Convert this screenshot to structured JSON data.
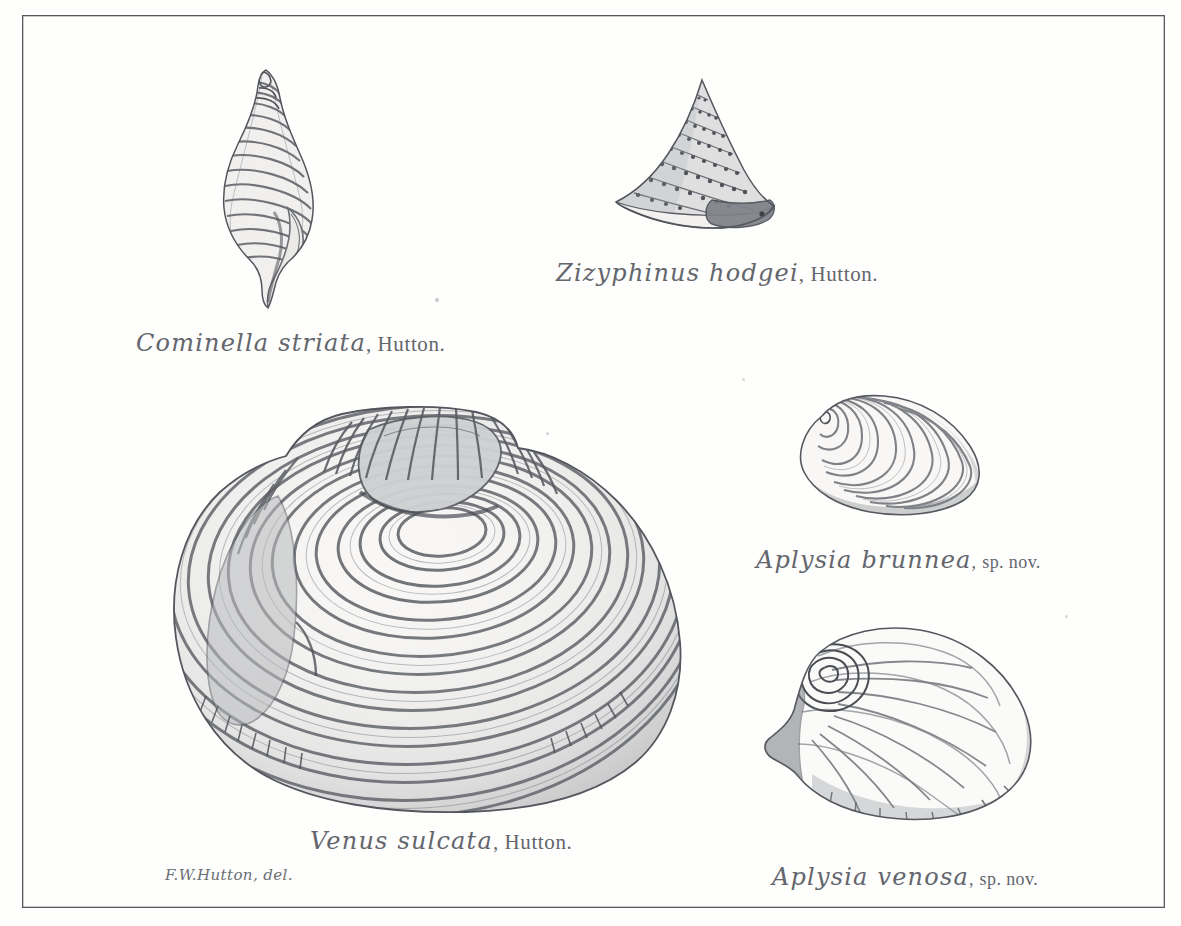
{
  "plate": {
    "background_color": "#fefefd",
    "frame_color": "#555a5e",
    "ink_color": "#63666c",
    "medium": "lithograph",
    "credit": "F.W.Hutton, del."
  },
  "figures": [
    {
      "id": "cominella-striata",
      "icon": "gastropod-fusiform-shell-icon",
      "species": "Cominella striata",
      "authority": "Hutton.",
      "position": {
        "x": 196,
        "y": 62,
        "width": 150,
        "height": 250
      }
    },
    {
      "id": "zizyphinus-hodgei",
      "icon": "gastropod-conical-top-shell-icon",
      "species": "Zizyphinus hodgei",
      "authority": "Hutton.",
      "position": {
        "x": 604,
        "y": 74,
        "width": 192,
        "height": 160
      }
    },
    {
      "id": "venus-sulcata",
      "icon": "bivalve-concentric-ribbed-shell-icon",
      "species": "Venus sulcata",
      "authority": "Hutton.",
      "position": {
        "x": 146,
        "y": 396,
        "width": 548,
        "height": 420
      }
    },
    {
      "id": "aplysia-brunnea",
      "icon": "ear-shaped-shell-icon",
      "species": "Aplysia brunnea",
      "authority": "sp. nov.",
      "position": {
        "x": 788,
        "y": 386,
        "width": 206,
        "height": 136
      }
    },
    {
      "id": "aplysia-venosa",
      "icon": "ear-shaped-veined-shell-icon",
      "species": "Aplysia venosa",
      "authority": "sp. nov.",
      "position": {
        "x": 758,
        "y": 616,
        "width": 282,
        "height": 212
      }
    }
  ],
  "captions": {
    "cominella": {
      "species": "Cominella striata",
      "separator": ",",
      "authority": "Hutton."
    },
    "zizyphinus": {
      "species": "Zizyphinus hodgei",
      "separator": ",",
      "authority": "Hutton."
    },
    "venus": {
      "species": "Venus sulcata",
      "separator": ",",
      "authority": "Hutton."
    },
    "brunnea": {
      "species": "Aplysia brunnea",
      "separator": ",",
      "authority": "sp. nov."
    },
    "venosa": {
      "species": "Aplysia venosa",
      "separator": ",",
      "authority": "sp. nov."
    }
  }
}
